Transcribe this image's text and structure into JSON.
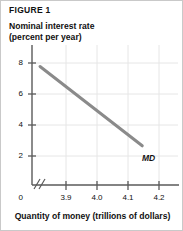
{
  "figure": {
    "label": "FIGURE 1",
    "y_axis_title_line1": "Nominal interest rate",
    "y_axis_title_line2": "(percent per year)",
    "x_axis_title": "Quantity of money (trillions of dollars)"
  },
  "chart_data": {
    "type": "line",
    "title": "FIGURE 1",
    "xlabel": "Quantity of money (trillions of dollars)",
    "ylabel": "Nominal interest rate (percent per year)",
    "xlim": [
      3.85,
      4.25
    ],
    "ylim": [
      0,
      9
    ],
    "grid": true,
    "legend": "none",
    "axis_break_x": true,
    "axis_break_y": true,
    "xticks": [
      "3.9",
      "4.0",
      "4.1",
      "4.2"
    ],
    "xtick_values": [
      3.9,
      4.0,
      4.1,
      4.2
    ],
    "yticks": [
      "0",
      "2",
      "4",
      "6",
      "8"
    ],
    "ytick_values": [
      0,
      2,
      4,
      6,
      8
    ],
    "origin_label": "0",
    "series": [
      {
        "name": "MD",
        "label": "MD",
        "color": "#8a8a8a",
        "x": [
          3.872,
          4.152
        ],
        "y": [
          7.62,
          2.52
        ]
      }
    ],
    "annotations": [
      {
        "text": "MD",
        "x": 4.168,
        "y": 2.3
      }
    ]
  }
}
